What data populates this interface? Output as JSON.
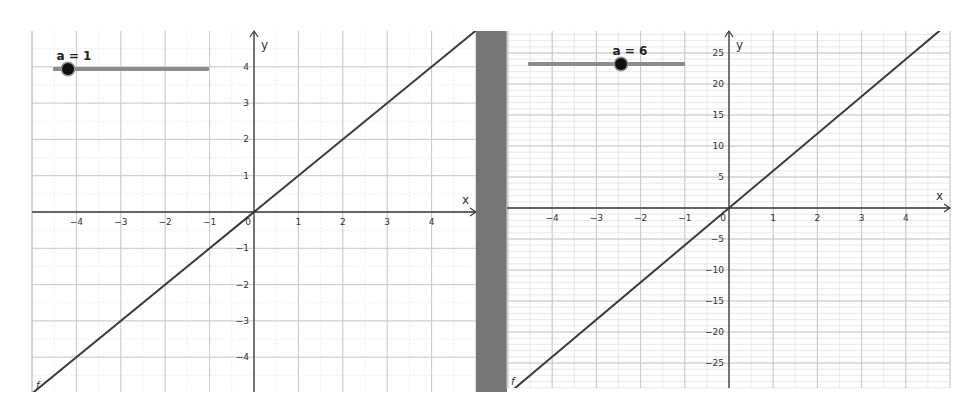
{
  "chart_data": [
    {
      "type": "line",
      "title": "",
      "function_name": "f",
      "expression": "f(x) = a·x",
      "slider": {
        "name": "a",
        "value": 1,
        "label": "a = 1"
      },
      "xlabel": "x",
      "ylabel": "y",
      "xlim": [
        -5.0,
        5.0
      ],
      "ylim": [
        -4.9,
        5.0
      ],
      "x_ticks": [
        -4,
        -3,
        -2,
        -1,
        0,
        1,
        2,
        3,
        4
      ],
      "y_ticks": [
        -4,
        -3,
        -2,
        -1,
        1,
        2,
        3,
        4
      ],
      "grid": true,
      "series": [
        {
          "name": "f",
          "x": [
            -5,
            5
          ],
          "y": [
            -5,
            5
          ]
        }
      ]
    },
    {
      "type": "line",
      "title": "",
      "function_name": "f",
      "expression": "f(x) = a·x",
      "slider": {
        "name": "a",
        "value": 6,
        "label": "a = 6"
      },
      "xlabel": "x",
      "ylabel": "y",
      "xlim": [
        -5.0,
        5.0
      ],
      "ylim": [
        -29,
        28.5
      ],
      "x_ticks": [
        -4,
        -3,
        -2,
        -1,
        0,
        1,
        2,
        3,
        4
      ],
      "y_ticks": [
        -25,
        -20,
        -15,
        -10,
        -5,
        5,
        10,
        15,
        20,
        25
      ],
      "grid": true,
      "series": [
        {
          "name": "f",
          "x": [
            -5,
            5
          ],
          "y": [
            -30,
            30
          ]
        }
      ]
    }
  ],
  "left": {
    "slider_label": "a = 1",
    "slider_value": 1,
    "axis_x_label": "x",
    "axis_y_label": "y",
    "origin_label": "0",
    "curve_label": "f"
  },
  "right": {
    "slider_label": "a = 6",
    "slider_value": 6,
    "axis_x_label": "x",
    "axis_y_label": "y",
    "origin_label": "0",
    "curve_label": "f"
  },
  "colors": {
    "line": "#3a3a3a",
    "axis": "#3a3a3a",
    "grid_major": "#c8c8c8",
    "grid_minor": "#e4e4e4",
    "divider": "#767676",
    "slider_track": "#8c8c8c",
    "slider_knob": "#111111"
  }
}
